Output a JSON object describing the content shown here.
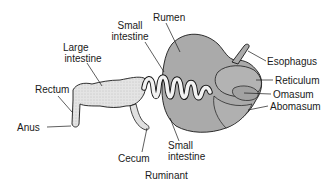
{
  "caption": "Ruminant",
  "labels": {
    "rumen": "Rumen",
    "small_intestine_top": [
      "Small",
      "intestine"
    ],
    "large_intestine": [
      "Large",
      "intestine"
    ],
    "rectum": "Rectum",
    "anus": "Anus",
    "cecum": "Cecum",
    "small_intestine_bottom": [
      "Small",
      "intestine"
    ],
    "esophagus": "Esophagus",
    "reticulum": "Reticulum",
    "omasum": "Omasum",
    "abomasum": "Abomasum"
  },
  "colors": {
    "stomach_fill": "#a9a9a9",
    "intestine_fill": "#d8d8d8",
    "outline": "#1a1a1a",
    "leader": "#1a1a1a",
    "text": "#1a1a1a"
  }
}
